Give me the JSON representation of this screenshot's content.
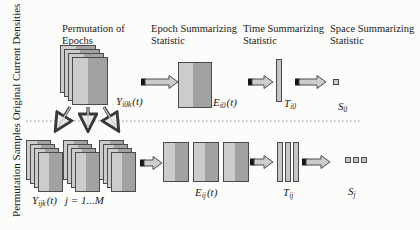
{
  "palette": {
    "bg": "#fcfcfa",
    "text": "#1b1b1b",
    "card_light": "#cccccc",
    "card_dark": "#a2a2a2",
    "card_border": "#4a4a4a",
    "bar_fill": "#c6c6c6",
    "arrow_fill": "#cccccc",
    "arrow_outline": "#3a3a3a",
    "arrow_tail": "#161616",
    "arrow_head_fill": "#e8e8e8",
    "dotted": "#8a8a8a"
  },
  "headers": [
    {
      "label": "Permutation of Epochs"
    },
    {
      "label": "Epoch Summarizing Statistic"
    },
    {
      "label": "Time Summarizing Statistic"
    },
    {
      "label": "Space Summarizing Statistic"
    }
  ],
  "row_labels": {
    "top": "Original Current Densities",
    "bottom": "Permutation Samples"
  },
  "math": {
    "y_top": {
      "base": "Y",
      "sub": "i0k",
      "arg": "(t)"
    },
    "e_top": {
      "base": "E",
      "sub": "i0",
      "arg": "(t)"
    },
    "t_top": {
      "base": "T",
      "sub": "i0"
    },
    "s_top": {
      "base": "S",
      "sub": "0"
    },
    "y_bot": {
      "base": "Y",
      "sub": "ijk",
      "arg": "(t)",
      "extra": "j = 1...M"
    },
    "e_bot": {
      "base": "E",
      "sub": "ij",
      "arg": "(t)"
    },
    "t_bot": {
      "base": "T",
      "sub": "ij"
    },
    "s_bot": {
      "base": "S",
      "sub": "j"
    }
  }
}
